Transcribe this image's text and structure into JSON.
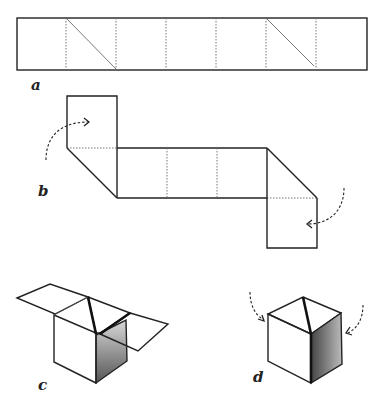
{
  "figure": {
    "panels": [
      {
        "id": "a",
        "label": "a",
        "caption": "Strip of seven squares with two diagonal fold lines"
      },
      {
        "id": "b",
        "label": "b",
        "caption": "End squares folded along diagonals; arrows show folding direction"
      },
      {
        "id": "c",
        "label": "c",
        "caption": "Partially folded box with open flaps"
      },
      {
        "id": "d",
        "label": "d",
        "caption": "Completed cube; arrows show final folds"
      }
    ]
  },
  "colors": {
    "line": "#222222",
    "fold_line": "#666666",
    "shade": "#8a8a8a",
    "background": "#ffffff"
  }
}
